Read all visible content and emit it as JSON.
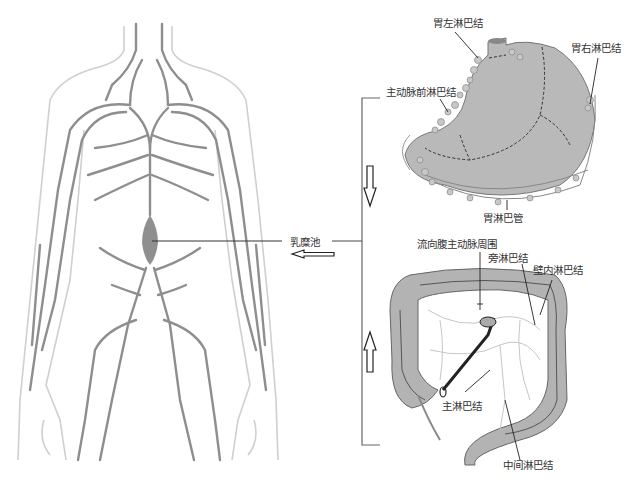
{
  "figure": {
    "type": "anatomical lymphatic drainage diagram",
    "panels": {
      "body": {
        "label": "乳糜池",
        "description": "human torso lymphatic vessels outline"
      },
      "stomach": {
        "labels": {
          "left_gastric": "胃左淋巴结",
          "right_gastric": "胃右淋巴结",
          "preaortic": "主动脉前淋巴结",
          "gastric_vessels": "胃淋巴管"
        }
      },
      "colon": {
        "labels": {
          "to_aorta": "流向腹主动脉周围",
          "paracolic": "旁淋巴结",
          "intramural": "壁内淋巴结",
          "main": "主淋巴结",
          "intermediate": "中间淋巴结"
        }
      }
    },
    "arrows": {
      "to_cisterna": "left",
      "stomach_flow": "down",
      "colon_flow": "up"
    },
    "colors": {
      "vessel": "#8a8a8a",
      "outline": "#c8c8c8",
      "organ_fill": "#b5b5b5",
      "line": "#555555"
    }
  }
}
